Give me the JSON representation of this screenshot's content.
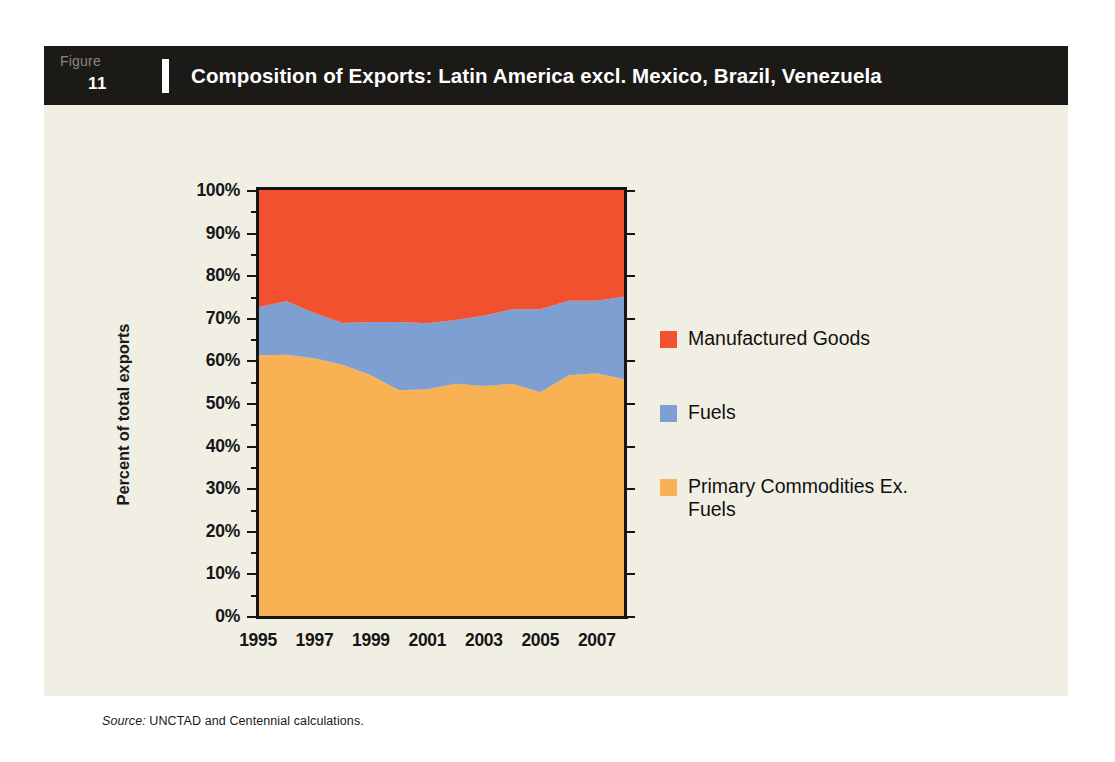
{
  "figure": {
    "label_word": "Figure",
    "number": "11",
    "title": "Composition of Exports: Latin America excl. Mexico, Brazil, Venezuela"
  },
  "source": {
    "label": "Source:",
    "text": " UNCTAD and Centennial calculations."
  },
  "colors": {
    "manufactured_goods": "#f2512f",
    "fuels": "#7d9fd1",
    "primary_commodities": "#f8b153",
    "card_background": "#f1efe4",
    "header_background": "#1c1a17",
    "axis": "#151515",
    "page_background": "#ffffff"
  },
  "legend": {
    "position": "right",
    "items": [
      {
        "label": "Manufactured Goods",
        "color": "#f2512f",
        "swatch": "legend-swatch-manufactured-goods"
      },
      {
        "label": "Fuels",
        "color": "#7d9fd1",
        "swatch": "legend-swatch-fuels"
      },
      {
        "label": "Primary Commodities Ex. Fuels",
        "color": "#f8b153",
        "swatch": "legend-swatch-primary-commodities"
      }
    ]
  },
  "chart_data": {
    "type": "area",
    "stacked": true,
    "stack_total": 100,
    "title": "Composition of Exports: Latin America excl. Mexico, Brazil, Venezuela",
    "xlabel": "",
    "ylabel": "Percent of total exports",
    "ylim": [
      0,
      100
    ],
    "ytick_labels": [
      "0%",
      "10%",
      "20%",
      "30%",
      "40%",
      "50%",
      "60%",
      "70%",
      "80%",
      "90%",
      "100%"
    ],
    "ytick_values": [
      0,
      10,
      20,
      30,
      40,
      50,
      60,
      70,
      80,
      90,
      100
    ],
    "xtick_labels": [
      "1995",
      "1997",
      "1999",
      "2001",
      "2003",
      "2005",
      "2007"
    ],
    "xtick_values": [
      1995,
      1997,
      1999,
      2001,
      2003,
      2005,
      2007
    ],
    "xlim": [
      1995,
      2008
    ],
    "grid": false,
    "x": [
      1995,
      1996,
      1997,
      1998,
      1999,
      2000,
      2001,
      2002,
      2003,
      2004,
      2005,
      2006,
      2007,
      2008
    ],
    "series": [
      {
        "name": "Primary Commodities Ex. Fuels",
        "color": "#f8b153",
        "values": [
          61.2,
          61.3,
          60.5,
          59.0,
          56.5,
          53.0,
          53.2,
          54.5,
          54.0,
          54.5,
          52.5,
          56.5,
          57.0,
          55.5
        ]
      },
      {
        "name": "Fuels",
        "color": "#7d9fd1",
        "values": [
          11.3,
          12.6,
          10.6,
          9.8,
          12.5,
          16.0,
          15.5,
          15.0,
          16.5,
          17.5,
          19.5,
          17.5,
          17.0,
          19.5
        ]
      },
      {
        "name": "Manufactured Goods",
        "color": "#f2512f",
        "values": [
          27.5,
          26.1,
          28.9,
          31.2,
          31.0,
          31.0,
          31.3,
          30.5,
          29.5,
          28.0,
          28.0,
          26.0,
          26.0,
          25.0
        ]
      }
    ],
    "cumulative_upper_bounds": {
      "primary_commodities": [
        61.2,
        61.3,
        60.5,
        59.0,
        56.5,
        53.0,
        53.2,
        54.5,
        54.0,
        54.5,
        52.5,
        56.5,
        57.0,
        55.5
      ],
      "fuels": [
        72.5,
        73.9,
        71.1,
        68.8,
        69.0,
        69.0,
        68.7,
        69.5,
        70.5,
        72.0,
        72.0,
        74.0,
        74.0,
        75.0
      ],
      "manufactured_goods": [
        100,
        100,
        100,
        100,
        100,
        100,
        100,
        100,
        100,
        100,
        100,
        100,
        100,
        100
      ]
    }
  }
}
